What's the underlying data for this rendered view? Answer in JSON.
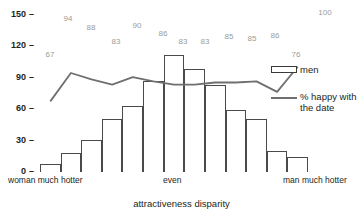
{
  "chart_data": {
    "type": "bar",
    "title": "",
    "xlabel": "attractiveness disparity",
    "ylabel": "",
    "ylim": [
      0,
      150
    ],
    "grid": false,
    "y_ticks": [
      "0",
      "30",
      "60",
      "90",
      "120",
      "150"
    ],
    "categories": [
      "1",
      "2",
      "3",
      "4",
      "5",
      "6",
      "7",
      "8",
      "9",
      "10",
      "11",
      "12",
      "13"
    ],
    "category_labels": {
      "left": "woman much hotter",
      "center": "even",
      "right": "man much hotter"
    },
    "series": [
      {
        "name": "men",
        "type": "bar",
        "values": [
          8,
          18,
          30,
          50,
          63,
          86,
          111,
          98,
          83,
          59,
          50,
          20,
          14
        ]
      },
      {
        "name": "% happy with the date",
        "type": "line",
        "values": [
          67,
          94,
          88,
          83,
          90,
          86,
          83,
          83,
          85,
          85,
          86,
          76,
          100
        ],
        "labels": [
          "67",
          "94",
          "88",
          "83",
          "90",
          "86",
          "83",
          "83",
          "85",
          "85",
          "86",
          "76",
          "100"
        ]
      }
    ],
    "legend": {
      "position": "right",
      "entries": [
        {
          "label": "men",
          "marker": "bar-swatch"
        },
        {
          "label": "% happy with\nthe date",
          "marker": "line-swatch"
        }
      ]
    },
    "colors": {
      "bar_stroke": "#4a4a4a",
      "bar_fill": "#ffffff",
      "line": "#6f6f6f",
      "label_gray": "#9b9b9b",
      "text": "#231f20"
    }
  },
  "legend": {
    "men_label": "men",
    "happy_label_line1": "% happy with",
    "happy_label_line2": "the date"
  },
  "axis": {
    "y0": "0",
    "y30": "30",
    "y60": "60",
    "y90": "90",
    "y120": "120",
    "y150": "150",
    "tick_dash": "–",
    "x_left": "woman much hotter",
    "x_center": "even",
    "x_right": "man much hotter",
    "x_title": "attractiveness disparity"
  },
  "pct_labels": {
    "p0": "67",
    "p1": "94",
    "p2": "88",
    "p3": "83",
    "p4": "90",
    "p5": "86",
    "p6": "83",
    "p7": "83",
    "p8": "85",
    "p9": "85",
    "p10": "86",
    "p11": "76",
    "p12": "100"
  }
}
